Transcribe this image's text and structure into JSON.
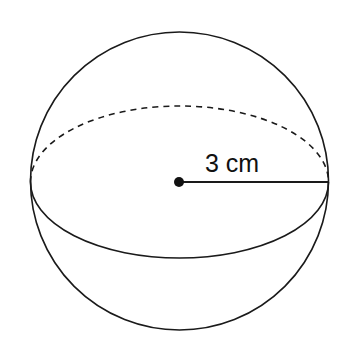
{
  "diagram": {
    "type": "sphere",
    "radius_label": "3 cm",
    "colors": {
      "stroke": "#1a1a1a",
      "background": "#ffffff"
    }
  }
}
